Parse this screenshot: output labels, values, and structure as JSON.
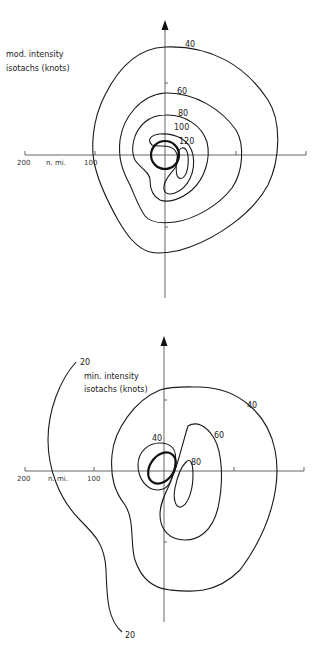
{
  "panels": [
    {
      "id": "top",
      "title_line1": "mod. intensity",
      "title_line2": "isotachs (knots)",
      "axis": {
        "label_200": "200",
        "label_units": "n. mi.",
        "label_100": "100"
      },
      "contours": [
        {
          "value": 40,
          "label": "40"
        },
        {
          "value": 60,
          "label": "60"
        },
        {
          "value": 80,
          "label": "80"
        },
        {
          "value": 100,
          "label": "100"
        },
        {
          "value": 120,
          "label": "120"
        }
      ]
    },
    {
      "id": "bottom",
      "title_line1": "min. intensity",
      "title_line2": "isotachs (knots)",
      "axis": {
        "label_200": "200",
        "label_units": "n. mi.",
        "label_100": "100"
      },
      "contours": [
        {
          "value": 20,
          "label": "20",
          "label_bottom": "20"
        },
        {
          "value": 40,
          "label_outer": "40",
          "label_inner": "40"
        },
        {
          "value": 60,
          "label": "60"
        },
        {
          "value": 80,
          "label": "80"
        }
      ]
    }
  ],
  "colors": {
    "line": "#1a1a1a",
    "axis": "#555555",
    "background": "#ffffff"
  }
}
